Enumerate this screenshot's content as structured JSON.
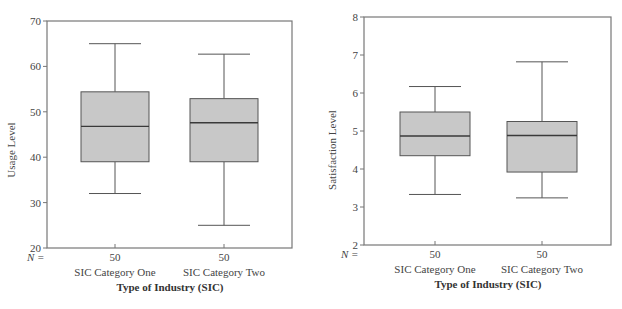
{
  "chart_data": [
    {
      "type": "boxplot",
      "title": "",
      "xlabel": "Type of Industry (SIC)",
      "ylabel": "Usage Level",
      "ylim": [
        20,
        70
      ],
      "yticks": [
        20,
        30,
        40,
        50,
        60,
        70
      ],
      "grid": false,
      "n_label": "N =",
      "categories": [
        "SIC Category One",
        "SIC Category Two"
      ],
      "n": [
        50,
        50
      ],
      "boxes": [
        {
          "category": "SIC Category One",
          "whisker_low": 32,
          "q1": 39,
          "median": 46.8,
          "q3": 54.4,
          "whisker_high": 65
        },
        {
          "category": "SIC Category Two",
          "whisker_low": 25,
          "q1": 39,
          "median": 47.6,
          "q3": 52.9,
          "whisker_high": 62.7
        }
      ]
    },
    {
      "type": "boxplot",
      "title": "",
      "xlabel": "Type of Industry (SIC)",
      "ylabel": "Satisfaction Level",
      "ylim": [
        2,
        8
      ],
      "yticks": [
        2,
        3,
        4,
        5,
        6,
        7,
        8
      ],
      "grid": false,
      "n_label": "N =",
      "categories": [
        "SIC Category One",
        "SIC Category Two"
      ],
      "n": [
        50,
        50
      ],
      "boxes": [
        {
          "category": "SIC Category One",
          "whisker_low": 3.33,
          "q1": 4.35,
          "median": 4.87,
          "q3": 5.5,
          "whisker_high": 6.17
        },
        {
          "category": "SIC Category Two",
          "whisker_low": 3.24,
          "q1": 3.92,
          "median": 4.88,
          "q3": 5.25,
          "whisker_high": 6.82
        }
      ]
    }
  ],
  "style": {
    "box_fill": "#c8c8c8",
    "line_color": "#555555",
    "frame_color": "#777777"
  },
  "left": {
    "ylabel": "Usage Level",
    "xlabel": "Type of Industry (SIC)",
    "n_label": "N =",
    "yticks": [
      "70",
      "60",
      "50",
      "40",
      "30",
      "20"
    ],
    "categories": [
      "SIC Category One",
      "SIC Category Two"
    ],
    "n": [
      "50",
      "50"
    ]
  },
  "right": {
    "ylabel": "Satisfaction Level",
    "xlabel": "Type of Industry (SIC)",
    "n_label": "N =",
    "yticks": [
      "8",
      "7",
      "6",
      "5",
      "4",
      "3",
      "2"
    ],
    "categories": [
      "SIC Category One",
      "SIC Category Two"
    ],
    "n": [
      "50",
      "50"
    ]
  }
}
